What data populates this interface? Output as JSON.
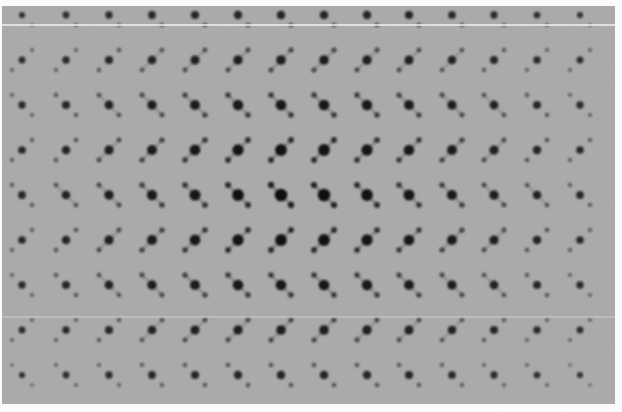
{
  "image": {
    "subject": "electron diffraction pattern",
    "caption": "",
    "background_color": "#ffffff",
    "film_color": "#a9a9a9",
    "spot_color": "#111111",
    "film_rect": {
      "x": 2,
      "y": 6,
      "w": 613,
      "h": 398
    },
    "scratch_lines": [
      {
        "y": 25,
        "x1": 2,
        "x2": 615,
        "color": "#f2f2f2",
        "width": 1.4
      },
      {
        "y": 317,
        "x1": 2,
        "x2": 615,
        "color": "#cfcfcf",
        "width": 1
      }
    ],
    "lattice": {
      "columns_x": [
        22,
        66,
        109,
        152,
        195,
        238,
        281,
        324,
        367,
        409,
        452,
        494,
        537,
        580
      ],
      "rows": [
        {
          "y": 15,
          "tilt": "back"
        },
        {
          "y": 60,
          "tilt": "forward"
        },
        {
          "y": 105,
          "tilt": "back"
        },
        {
          "y": 150,
          "tilt": "forward"
        },
        {
          "y": 195,
          "tilt": "back"
        },
        {
          "y": 240,
          "tilt": "forward"
        },
        {
          "y": 285,
          "tilt": "back"
        },
        {
          "y": 330,
          "tilt": "forward"
        },
        {
          "y": 375,
          "tilt": "back"
        }
      ],
      "center_x": 300,
      "center_y": 195,
      "satellite_offset": {
        "dx": 10,
        "dy": 10
      },
      "max_spot_radius": 6.5,
      "min_spot_radius": 2.5
    }
  }
}
